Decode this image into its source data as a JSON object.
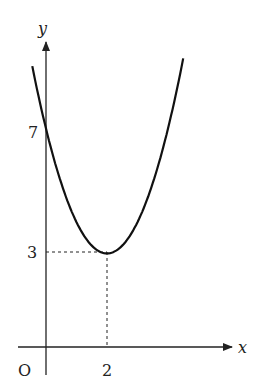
{
  "chart_data": {
    "type": "line",
    "title": "",
    "xlabel": "x",
    "ylabel": "y",
    "origin_label": "O",
    "function": "y = (x - 2)^2 + 3",
    "vertex": {
      "x": 2,
      "y": 3
    },
    "y_intercept": 7,
    "x_ticks": [
      {
        "value": 2,
        "label": "2"
      }
    ],
    "y_ticks": [
      {
        "value": 3,
        "label": "3"
      },
      {
        "value": 7,
        "label": "7"
      }
    ],
    "guides": [
      {
        "from": [
          0,
          3
        ],
        "to": [
          2,
          3
        ],
        "style": "dashed"
      },
      {
        "from": [
          2,
          0
        ],
        "to": [
          2,
          3
        ],
        "style": "dashed"
      }
    ],
    "xlim": [
      -0.5,
      4.5
    ],
    "ylim": [
      0,
      9.5
    ],
    "grid": false,
    "series": [
      {
        "name": "parabola",
        "x": [
          -0.5,
          0,
          0.5,
          1,
          1.5,
          2,
          2.5,
          3,
          3.5,
          4,
          4.5
        ],
        "y": [
          9.25,
          7,
          5.25,
          4,
          3.25,
          3,
          3.25,
          4,
          5.25,
          7,
          9.25
        ]
      }
    ]
  },
  "labels": {
    "x_axis": "x",
    "y_axis": "y",
    "origin": "O",
    "tick_x_2": "2",
    "tick_y_3": "3",
    "tick_y_7": "7"
  }
}
